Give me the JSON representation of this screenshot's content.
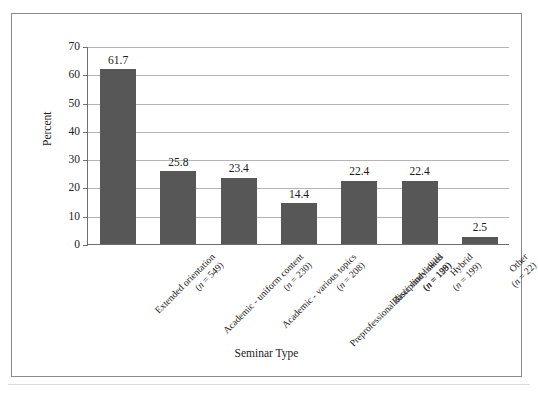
{
  "chart_data": {
    "type": "bar",
    "title": "",
    "xlabel": "Seminar Type",
    "ylabel": "Percent",
    "ylim": [
      0,
      70
    ],
    "ytick_step": 10,
    "yticks": [
      0,
      10,
      20,
      30,
      40,
      50,
      60,
      70
    ],
    "ytick_labels": [
      "0",
      "10",
      "20",
      "30",
      "40",
      "50",
      "60",
      "70"
    ],
    "grid": "horizontal",
    "legend": "none",
    "bar_color": "#575757",
    "categories": [
      "Extended orientation",
      "Academic - uniform content",
      "Academic - various topics",
      "Preprofessional/discipline-linked",
      "Basic study skills",
      "Hybrid",
      "Other"
    ],
    "category_n": [
      "(n = 549)",
      "(n = 230)",
      "(n = 208)",
      "(n = 128)",
      "(n = 199)",
      "(n = 199)",
      "(n = 22)"
    ],
    "values": [
      61.7,
      25.8,
      23.4,
      14.4,
      22.4,
      22.4,
      2.5
    ],
    "value_labels": [
      "61.7",
      "25.8",
      "23.4",
      "14.4",
      "22.4",
      "22.4",
      "2.5"
    ]
  }
}
